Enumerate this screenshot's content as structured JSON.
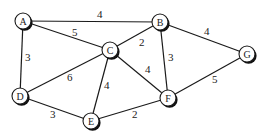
{
  "graph": {
    "nodes": [
      {
        "id": "A",
        "label": "A",
        "x": 23,
        "y": 21
      },
      {
        "id": "B",
        "label": "B",
        "x": 160,
        "y": 22
      },
      {
        "id": "C",
        "label": "C",
        "x": 110,
        "y": 50
      },
      {
        "id": "D",
        "label": "D",
        "x": 20,
        "y": 96
      },
      {
        "id": "E",
        "label": "E",
        "x": 91,
        "y": 121
      },
      {
        "id": "F",
        "label": "F",
        "x": 168,
        "y": 98
      },
      {
        "id": "G",
        "label": "G",
        "x": 247,
        "y": 54
      }
    ],
    "edges": [
      {
        "from": "A",
        "to": "B",
        "weight": "4",
        "lx": 97,
        "ly": 18
      },
      {
        "from": "A",
        "to": "C",
        "weight": "5",
        "lx": 72,
        "ly": 36
      },
      {
        "from": "A",
        "to": "D",
        "weight": "3",
        "lx": 25,
        "ly": 61
      },
      {
        "from": "B",
        "to": "C",
        "weight": "2",
        "lx": 139,
        "ly": 46
      },
      {
        "from": "B",
        "to": "F",
        "weight": "3",
        "lx": 168,
        "ly": 61
      },
      {
        "from": "B",
        "to": "G",
        "weight": "4",
        "lx": 204,
        "ly": 35
      },
      {
        "from": "C",
        "to": "D",
        "weight": "6",
        "lx": 67,
        "ly": 81
      },
      {
        "from": "C",
        "to": "E",
        "weight": "4",
        "lx": 104,
        "ly": 89
      },
      {
        "from": "C",
        "to": "F",
        "weight": "4",
        "lx": 145,
        "ly": 73
      },
      {
        "from": "D",
        "to": "E",
        "weight": "3",
        "lx": 50,
        "ly": 118
      },
      {
        "from": "E",
        "to": "F",
        "weight": "2",
        "lx": 132,
        "ly": 118
      },
      {
        "from": "F",
        "to": "G",
        "weight": "5",
        "lx": 212,
        "ly": 83
      }
    ]
  },
  "style": {
    "node_radius": 8,
    "line_color": "#1a1a1a",
    "background": "#ffffff"
  }
}
